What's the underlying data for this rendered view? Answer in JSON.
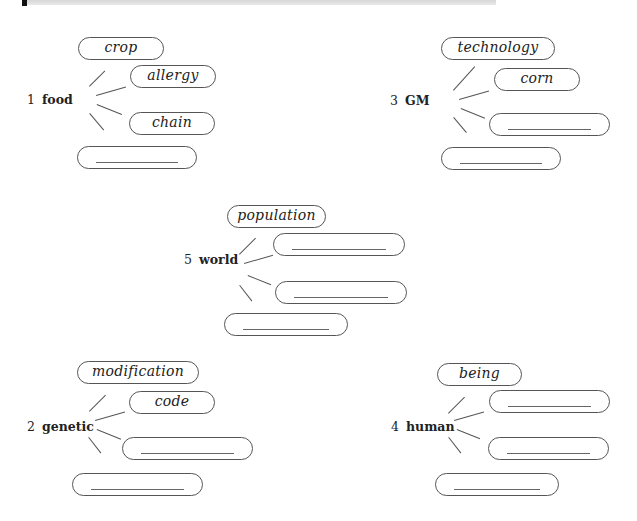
{
  "header": {
    "bar": "section-divider"
  },
  "clusters": [
    {
      "id": "1",
      "number": "1",
      "keyword": "food",
      "pills": [
        {
          "text": "crop",
          "filled": true
        },
        {
          "text": "allergy",
          "filled": true
        },
        {
          "text": "chain",
          "filled": true
        },
        {
          "text": "",
          "filled": false
        }
      ]
    },
    {
      "id": "3",
      "number": "3",
      "keyword": "GM",
      "pills": [
        {
          "text": "technology",
          "filled": true
        },
        {
          "text": "corn",
          "filled": true
        },
        {
          "text": "",
          "filled": false
        },
        {
          "text": "",
          "filled": false
        }
      ]
    },
    {
      "id": "5",
      "number": "5",
      "keyword": "world",
      "pills": [
        {
          "text": "population",
          "filled": true
        },
        {
          "text": "",
          "filled": false
        },
        {
          "text": "",
          "filled": false
        },
        {
          "text": "",
          "filled": false
        }
      ]
    },
    {
      "id": "2",
      "number": "2",
      "keyword": "genetic",
      "pills": [
        {
          "text": "modification",
          "filled": true
        },
        {
          "text": "code",
          "filled": true
        },
        {
          "text": "",
          "filled": false
        },
        {
          "text": "",
          "filled": false
        }
      ]
    },
    {
      "id": "4",
      "number": "4",
      "keyword": "human",
      "pills": [
        {
          "text": "being",
          "filled": true
        },
        {
          "text": "",
          "filled": false
        },
        {
          "text": "",
          "filled": false
        },
        {
          "text": "",
          "filled": false
        }
      ]
    }
  ]
}
